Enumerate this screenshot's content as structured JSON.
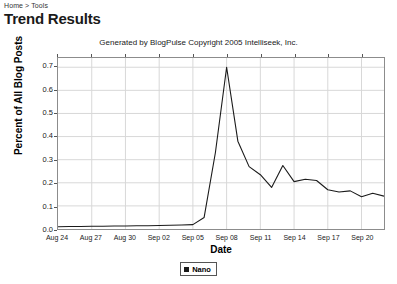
{
  "breadcrumb": {
    "text": "Home > Tools",
    "home_label": "Home",
    "separator": ">",
    "tools_label": "Tools"
  },
  "page": {
    "title": "Trend Results"
  },
  "chart_caption": "Generated by BlogPulse Copyright 2005 Intelliseek, Inc.",
  "legend": {
    "entries": [
      {
        "label": "Nano",
        "color": "#1a1a1a"
      }
    ]
  },
  "chart_data": {
    "type": "line",
    "title": "",
    "subtitle": "Generated by BlogPulse Copyright 2005 Intelliseek, Inc.",
    "xlabel": "Date",
    "ylabel": "Percent of All Blog Posts",
    "grid": true,
    "legend_position": "bottom",
    "xlim": [
      0,
      29
    ],
    "ylim": [
      0.0,
      0.74
    ],
    "ytick_labels": [
      "0.0",
      "0.1",
      "0.2",
      "0.3",
      "0.4",
      "0.5",
      "0.6",
      "0.7"
    ],
    "ytick_values": [
      0.0,
      0.1,
      0.2,
      0.3,
      0.4,
      0.5,
      0.6,
      0.7
    ],
    "xtick_labels": [
      "Aug 24",
      "Aug 27",
      "Aug 30",
      "Sep 02",
      "Sep 05",
      "Sep 08",
      "Sep 11",
      "Sep 14",
      "Sep 17",
      "Sep 20"
    ],
    "xtick_indices": [
      0,
      3,
      6,
      9,
      12,
      15,
      18,
      21,
      24,
      27
    ],
    "x": [
      0,
      1,
      2,
      3,
      4,
      5,
      6,
      7,
      8,
      9,
      10,
      11,
      12,
      13,
      14,
      15,
      16,
      17,
      18,
      19,
      20,
      21,
      22,
      23,
      24,
      25,
      26,
      27,
      28,
      29
    ],
    "series": [
      {
        "name": "Nano",
        "color": "#1a1a1a",
        "values": [
          0.01,
          0.011,
          0.011,
          0.012,
          0.012,
          0.013,
          0.013,
          0.014,
          0.014,
          0.015,
          0.016,
          0.017,
          0.019,
          0.05,
          0.33,
          0.7,
          0.38,
          0.27,
          0.235,
          0.18,
          0.275,
          0.205,
          0.215,
          0.21,
          0.17,
          0.16,
          0.165,
          0.14,
          0.155,
          0.142
        ]
      }
    ]
  }
}
